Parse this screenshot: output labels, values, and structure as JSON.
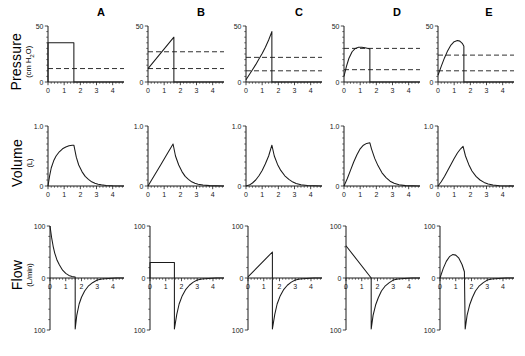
{
  "figure": {
    "width": 525,
    "height": 356,
    "background": "#ffffff",
    "ink": "#1a1a1a"
  },
  "columns": [
    {
      "id": "A",
      "label": "A"
    },
    {
      "id": "B",
      "label": "B"
    },
    {
      "id": "C",
      "label": "C"
    },
    {
      "id": "D",
      "label": "D"
    },
    {
      "id": "E",
      "label": "E"
    }
  ],
  "rows": [
    {
      "id": "pressure",
      "label": "Pressure",
      "unit": "(cm H2O)",
      "unit_html": "(cm H₂O)"
    },
    {
      "id": "volume",
      "label": "Volume",
      "unit": "(L)",
      "unit_html": "(L)"
    },
    {
      "id": "flow",
      "label": "Flow",
      "unit": "(L/min)",
      "unit_html": "(L/min)"
    }
  ],
  "chart_data": [
    {
      "id": "pressure-A",
      "type": "line",
      "row": "pressure",
      "column": "A",
      "title": "A",
      "xlabel": "",
      "ylabel": "Pressure (cm H2O)",
      "xlim": [
        0,
        4.7
      ],
      "ylim": [
        0,
        50
      ],
      "xticks": [
        0,
        1,
        2,
        3,
        4
      ],
      "yticks": [
        0,
        50
      ],
      "ytick_labels": [
        "0",
        "50"
      ],
      "grid": false,
      "annotations": [
        "baseline dashed line at 12 cm H2O"
      ],
      "dashed_levels": [
        12
      ],
      "series": [
        {
          "name": "airway pressure",
          "x": [
            0,
            0,
            1.6,
            1.6,
            4.7
          ],
          "y": [
            0,
            35,
            35,
            0,
            0
          ]
        }
      ]
    },
    {
      "id": "pressure-B",
      "type": "line",
      "row": "pressure",
      "column": "B",
      "title": "B",
      "xlabel": "",
      "ylabel": "Pressure (cm H2O)",
      "xlim": [
        0,
        4.7
      ],
      "ylim": [
        0,
        50
      ],
      "xticks": [
        0,
        1,
        2,
        3,
        4
      ],
      "yticks": [
        0,
        50
      ],
      "ytick_labels": [
        "0",
        "50"
      ],
      "grid": false,
      "annotations": [
        "dashed lines at 27 and 12 cm H2O"
      ],
      "dashed_levels": [
        27,
        12
      ],
      "series": [
        {
          "name": "airway pressure",
          "x": [
            0,
            1.6,
            1.6,
            4.7
          ],
          "y": [
            12,
            40,
            0,
            0
          ]
        }
      ]
    },
    {
      "id": "pressure-C",
      "type": "line",
      "row": "pressure",
      "column": "C",
      "title": "C",
      "xlabel": "",
      "ylabel": "Pressure (cm H2O)",
      "xlim": [
        0,
        4.7
      ],
      "ylim": [
        0,
        50
      ],
      "xticks": [
        0,
        1,
        2,
        3,
        4
      ],
      "yticks": [
        0,
        50
      ],
      "ytick_labels": [
        "0",
        "50"
      ],
      "grid": false,
      "annotations": [
        "dashed lines at 22 and 10 cm H2O"
      ],
      "dashed_levels": [
        22,
        10
      ],
      "series": [
        {
          "name": "airway pressure",
          "x": [
            0,
            0.2,
            0.4,
            0.6,
            0.8,
            1.0,
            1.2,
            1.4,
            1.6,
            1.6,
            4.7
          ],
          "y": [
            2,
            6.5,
            11,
            15.5,
            20.5,
            25.5,
            31,
            37.5,
            45,
            0,
            0
          ]
        }
      ]
    },
    {
      "id": "pressure-D",
      "type": "line",
      "row": "pressure",
      "column": "D",
      "title": "D",
      "xlabel": "",
      "ylabel": "Pressure (cm H2O)",
      "xlim": [
        0,
        4.7
      ],
      "ylim": [
        0,
        50
      ],
      "xticks": [
        0,
        1,
        2,
        3,
        4
      ],
      "yticks": [
        0,
        50
      ],
      "ytick_labels": [
        "0",
        "50"
      ],
      "grid": false,
      "annotations": [
        "dashed lines at 30 and 11 cm H2O"
      ],
      "dashed_levels": [
        30,
        11
      ],
      "series": [
        {
          "name": "airway pressure",
          "x": [
            0,
            0.15,
            0.3,
            0.5,
            0.7,
            0.9,
            1.1,
            1.3,
            1.5,
            1.6,
            1.6,
            4.7
          ],
          "y": [
            5,
            14,
            21,
            27,
            30,
            31,
            31,
            30.5,
            30,
            29.5,
            0,
            0
          ]
        }
      ]
    },
    {
      "id": "pressure-E",
      "type": "line",
      "row": "pressure",
      "column": "E",
      "title": "E",
      "xlabel": "",
      "ylabel": "Pressure (cm H2O)",
      "xlim": [
        0,
        4.7
      ],
      "ylim": [
        0,
        50
      ],
      "xticks": [
        0,
        1,
        2,
        3,
        4
      ],
      "yticks": [
        0,
        50
      ],
      "ytick_labels": [
        "0",
        "50"
      ],
      "grid": false,
      "annotations": [
        "dashed lines at 24 and 10 cm H2O"
      ],
      "dashed_levels": [
        24,
        10
      ],
      "series": [
        {
          "name": "airway pressure",
          "x": [
            0,
            0.2,
            0.4,
            0.6,
            0.8,
            1.0,
            1.2,
            1.35,
            1.5,
            1.6,
            1.6,
            4.7
          ],
          "y": [
            6,
            14,
            21.5,
            28,
            33,
            36,
            37,
            36.5,
            34.5,
            32,
            0,
            0
          ]
        }
      ]
    },
    {
      "id": "volume-A",
      "type": "line",
      "row": "volume",
      "column": "A",
      "title": "",
      "xlabel": "",
      "ylabel": "Volume (L)",
      "xlim": [
        0,
        4.7
      ],
      "ylim": [
        0,
        1.0
      ],
      "xticks": [
        0,
        1,
        2,
        3,
        4
      ],
      "yticks": [
        0,
        1.0
      ],
      "ytick_labels": [
        "0",
        "1.0"
      ],
      "grid": false,
      "dashed_levels": [],
      "series": [
        {
          "name": "tidal volume",
          "x": [
            0,
            0.1,
            0.2,
            0.35,
            0.5,
            0.7,
            0.9,
            1.1,
            1.3,
            1.5,
            1.6,
            1.75,
            1.9,
            2.1,
            2.3,
            2.5,
            2.7,
            2.9,
            3.1,
            3.3,
            3.6,
            4.0,
            4.7
          ],
          "y": [
            0,
            0.17,
            0.3,
            0.42,
            0.5,
            0.57,
            0.62,
            0.65,
            0.67,
            0.68,
            0.68,
            0.48,
            0.35,
            0.24,
            0.16,
            0.11,
            0.07,
            0.045,
            0.03,
            0.02,
            0.01,
            0.004,
            0
          ]
        }
      ]
    },
    {
      "id": "volume-B",
      "type": "line",
      "row": "volume",
      "column": "B",
      "title": "",
      "xlabel": "",
      "ylabel": "Volume (L)",
      "xlim": [
        0,
        4.7
      ],
      "ylim": [
        0,
        1.0
      ],
      "xticks": [
        0,
        1,
        2,
        3,
        4
      ],
      "yticks": [
        0,
        1.0
      ],
      "ytick_labels": [
        "0",
        "1.0"
      ],
      "grid": false,
      "dashed_levels": [],
      "series": [
        {
          "name": "tidal volume",
          "x": [
            0,
            0.4,
            0.8,
            1.2,
            1.55,
            1.7,
            1.9,
            2.1,
            2.3,
            2.5,
            2.7,
            2.9,
            3.1,
            3.4,
            3.8,
            4.7
          ],
          "y": [
            0,
            0.18,
            0.36,
            0.54,
            0.7,
            0.5,
            0.35,
            0.24,
            0.16,
            0.11,
            0.07,
            0.045,
            0.03,
            0.015,
            0.006,
            0
          ]
        }
      ]
    },
    {
      "id": "volume-C",
      "type": "line",
      "row": "volume",
      "column": "C",
      "title": "",
      "xlabel": "",
      "ylabel": "Volume (L)",
      "xlim": [
        0,
        4.7
      ],
      "ylim": [
        0,
        1.0
      ],
      "xticks": [
        0,
        1,
        2,
        3,
        4
      ],
      "yticks": [
        0,
        1.0
      ],
      "ytick_labels": [
        "0",
        "1.0"
      ],
      "grid": false,
      "dashed_levels": [],
      "series": [
        {
          "name": "tidal volume",
          "x": [
            0,
            0.2,
            0.4,
            0.6,
            0.8,
            1.0,
            1.2,
            1.4,
            1.6,
            1.75,
            1.95,
            2.15,
            2.4,
            2.65,
            2.9,
            3.1,
            3.4,
            3.8,
            4.7
          ],
          "y": [
            0,
            0.015,
            0.05,
            0.1,
            0.17,
            0.26,
            0.37,
            0.5,
            0.68,
            0.5,
            0.36,
            0.26,
            0.17,
            0.11,
            0.065,
            0.04,
            0.02,
            0.007,
            0
          ]
        }
      ]
    },
    {
      "id": "volume-D",
      "type": "line",
      "row": "volume",
      "column": "D",
      "title": "",
      "xlabel": "",
      "ylabel": "Volume (L)",
      "xlim": [
        0,
        4.7
      ],
      "ylim": [
        0,
        1.0
      ],
      "xticks": [
        0,
        1,
        2,
        3,
        4
      ],
      "yticks": [
        0,
        1.0
      ],
      "ytick_labels": [
        "0",
        "1.0"
      ],
      "grid": false,
      "dashed_levels": [],
      "series": [
        {
          "name": "tidal volume",
          "x": [
            0,
            0.2,
            0.4,
            0.6,
            0.8,
            1.0,
            1.2,
            1.4,
            1.6,
            1.7,
            1.9,
            2.1,
            2.35,
            2.6,
            2.85,
            3.1,
            3.4,
            3.8,
            4.7
          ],
          "y": [
            0,
            0.12,
            0.26,
            0.4,
            0.52,
            0.62,
            0.68,
            0.71,
            0.72,
            0.62,
            0.46,
            0.34,
            0.22,
            0.14,
            0.08,
            0.045,
            0.02,
            0.006,
            0
          ]
        }
      ]
    },
    {
      "id": "volume-E",
      "type": "line",
      "row": "volume",
      "column": "E",
      "title": "",
      "xlabel": "",
      "ylabel": "Volume (L)",
      "xlim": [
        0,
        4.7
      ],
      "ylim": [
        0,
        1.0
      ],
      "xticks": [
        0,
        1,
        2,
        3,
        4
      ],
      "yticks": [
        0,
        1.0
      ],
      "ytick_labels": [
        "0",
        "1.0"
      ],
      "grid": false,
      "dashed_levels": [],
      "series": [
        {
          "name": "tidal volume",
          "x": [
            0,
            0.2,
            0.4,
            0.6,
            0.8,
            1.0,
            1.2,
            1.4,
            1.55,
            1.7,
            1.9,
            2.1,
            2.35,
            2.6,
            2.85,
            3.1,
            3.4,
            3.8,
            4.7
          ],
          "y": [
            0,
            0.07,
            0.16,
            0.26,
            0.36,
            0.46,
            0.55,
            0.62,
            0.66,
            0.5,
            0.36,
            0.25,
            0.16,
            0.1,
            0.06,
            0.035,
            0.015,
            0.005,
            0
          ]
        }
      ]
    },
    {
      "id": "flow-A",
      "type": "line",
      "row": "flow",
      "column": "A",
      "title": "",
      "xlabel": "",
      "ylabel": "Flow (L/min)",
      "xlim": [
        0,
        4.7
      ],
      "ylim": [
        -100,
        100
      ],
      "xticks": [
        0,
        1,
        2,
        3,
        4
      ],
      "yticks": [
        -100,
        0,
        100
      ],
      "ytick_labels": [
        "-100",
        "0",
        "100"
      ],
      "grid": false,
      "dashed_levels": [],
      "series": [
        {
          "name": "inspiratory-expiratory flow",
          "x": [
            0,
            0.1,
            0.2,
            0.3,
            0.45,
            0.6,
            0.8,
            1.0,
            1.2,
            1.4,
            1.6,
            1.6,
            1.7,
            1.85,
            2.0,
            2.2,
            2.45,
            2.7,
            3.0,
            3.3,
            3.7,
            4.2,
            4.7
          ],
          "y": [
            100,
            78,
            61,
            48,
            34,
            25,
            15,
            9,
            5,
            3,
            2,
            -98,
            -72,
            -50,
            -37,
            -25,
            -15,
            -9,
            -4,
            -2,
            -0.8,
            -0.2,
            0
          ]
        }
      ]
    },
    {
      "id": "flow-B",
      "type": "line",
      "row": "flow",
      "column": "B",
      "title": "",
      "xlabel": "",
      "ylabel": "Flow (L/min)",
      "xlim": [
        0,
        4.7
      ],
      "ylim": [
        -100,
        100
      ],
      "xticks": [
        0,
        1,
        2,
        3,
        4
      ],
      "yticks": [
        -100,
        0,
        100
      ],
      "ytick_labels": [
        "-100",
        "0",
        "100"
      ],
      "grid": false,
      "dashed_levels": [],
      "series": [
        {
          "name": "inspiratory-expiratory flow",
          "x": [
            0,
            0,
            1.55,
            1.55,
            1.7,
            1.85,
            2.05,
            2.25,
            2.5,
            2.75,
            3.0,
            3.3,
            3.7,
            4.2,
            4.7
          ],
          "y": [
            0,
            30,
            30,
            -98,
            -70,
            -50,
            -34,
            -23,
            -14,
            -8,
            -4,
            -2,
            -0.8,
            -0.2,
            0
          ]
        }
      ]
    },
    {
      "id": "flow-C",
      "type": "line",
      "row": "flow",
      "column": "C",
      "title": "",
      "xlabel": "",
      "ylabel": "Flow (L/min)",
      "xlim": [
        0,
        4.7
      ],
      "ylim": [
        -100,
        100
      ],
      "xticks": [
        0,
        1,
        2,
        3,
        4
      ],
      "yticks": [
        -100,
        0,
        100
      ],
      "ytick_labels": [
        "-100",
        "0",
        "100"
      ],
      "grid": false,
      "dashed_levels": [],
      "series": [
        {
          "name": "inspiratory-expiratory flow",
          "x": [
            0,
            1.55,
            1.55,
            1.7,
            1.85,
            2.05,
            2.25,
            2.5,
            2.75,
            3.0,
            3.3,
            3.7,
            4.2,
            4.7
          ],
          "y": [
            2,
            50,
            -98,
            -70,
            -50,
            -34,
            -23,
            -14,
            -8,
            -4,
            -2,
            -0.8,
            -0.2,
            0
          ]
        }
      ]
    },
    {
      "id": "flow-D",
      "type": "line",
      "row": "flow",
      "column": "D",
      "title": "",
      "xlabel": "",
      "ylabel": "Flow (L/min)",
      "xlim": [
        0,
        4.7
      ],
      "ylim": [
        -100,
        100
      ],
      "xticks": [
        0,
        1,
        2,
        3,
        4
      ],
      "yticks": [
        -100,
        0,
        100
      ],
      "ytick_labels": [
        "-100",
        "0",
        "100"
      ],
      "grid": false,
      "dashed_levels": [],
      "series": [
        {
          "name": "inspiratory-expiratory flow",
          "x": [
            0,
            1.6,
            1.6,
            1.72,
            1.88,
            2.05,
            2.25,
            2.5,
            2.75,
            3.0,
            3.3,
            3.7,
            4.2,
            4.7
          ],
          "y": [
            62,
            0,
            -98,
            -72,
            -52,
            -38,
            -25,
            -15,
            -9,
            -4,
            -2,
            -0.8,
            -0.2,
            0
          ]
        }
      ]
    },
    {
      "id": "flow-E",
      "type": "line",
      "row": "flow",
      "column": "E",
      "title": "",
      "xlabel": "",
      "ylabel": "Flow (L/min)",
      "xlim": [
        0,
        4.7
      ],
      "ylim": [
        -100,
        100
      ],
      "xticks": [
        0,
        1,
        2,
        3,
        4
      ],
      "yticks": [
        -100,
        0,
        100
      ],
      "ytick_labels": [
        "-100",
        "0",
        "100"
      ],
      "grid": false,
      "dashed_levels": [],
      "series": [
        {
          "name": "inspiratory-expiratory flow",
          "x": [
            0,
            0.2,
            0.4,
            0.6,
            0.8,
            1.0,
            1.2,
            1.4,
            1.55,
            1.6,
            1.72,
            1.88,
            2.05,
            2.25,
            2.5,
            2.75,
            3.0,
            3.3,
            3.7,
            4.2,
            4.7
          ],
          "y": [
            0,
            18,
            32,
            41,
            45,
            44,
            38,
            26,
            12,
            -98,
            -72,
            -52,
            -38,
            -25,
            -15,
            -9,
            -4,
            -2,
            -0.8,
            -0.2,
            0
          ]
        }
      ]
    }
  ]
}
